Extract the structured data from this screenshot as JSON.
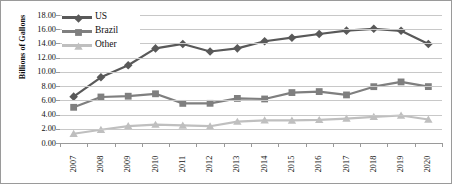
{
  "chart_data": {
    "type": "line",
    "title": "",
    "xlabel": "",
    "ylabel": "Billions of Gallons",
    "categories": [
      "2007",
      "2008",
      "2009",
      "2010",
      "2011",
      "2012",
      "2013",
      "2014",
      "2015",
      "2016",
      "2017",
      "2018",
      "2019",
      "2020"
    ],
    "x": [
      2007,
      2008,
      2009,
      2010,
      2011,
      2012,
      2013,
      2014,
      2015,
      2016,
      2017,
      2018,
      2019,
      2020
    ],
    "ylim": [
      0,
      18
    ],
    "ytick_interval": 2,
    "ytick_labels": [
      "0.00",
      "2.00",
      "4.00",
      "6.00",
      "8.00",
      "10.00",
      "12.00",
      "14.00",
      "16.00",
      "18.00"
    ],
    "grid": true,
    "legend_position": "top-left",
    "series": [
      {
        "name": "US",
        "color": "#595959",
        "marker": "diamond",
        "values": [
          6.52,
          9.24,
          10.94,
          13.3,
          13.93,
          12.87,
          13.31,
          14.31,
          14.81,
          15.33,
          15.8,
          16.06,
          15.78,
          13.93
        ]
      },
      {
        "name": "Brazil",
        "color": "#7f7f7f",
        "marker": "square",
        "values": [
          5.02,
          6.47,
          6.58,
          6.92,
          5.57,
          5.58,
          6.27,
          6.19,
          7.09,
          7.23,
          6.76,
          7.92,
          8.59,
          7.93
        ]
      },
      {
        "name": "Other",
        "color": "#bfbfbf",
        "marker": "triangle",
        "values": [
          1.3,
          1.86,
          2.38,
          2.58,
          2.47,
          2.36,
          3.0,
          3.19,
          3.17,
          3.25,
          3.43,
          3.68,
          3.87,
          3.3
        ]
      }
    ]
  },
  "legend": [
    {
      "label": "US"
    },
    {
      "label": "Brazil"
    },
    {
      "label": "Other"
    }
  ]
}
